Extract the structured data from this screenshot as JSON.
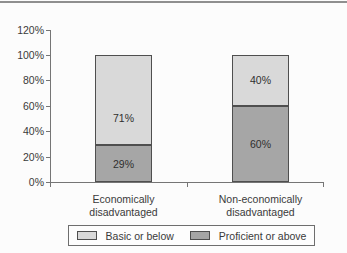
{
  "figure": {
    "background": "#fcfcfc",
    "top_rule_color": "#8f8f8f",
    "axis_color": "#757575",
    "text_color": "#3a3a3a",
    "bar_border_color": "#4f4f4f",
    "legend_border_color": "#6e6e6e"
  },
  "chart_data": {
    "type": "bar",
    "stacked": true,
    "title": "",
    "xlabel": "",
    "ylabel": "",
    "grid": false,
    "categories": [
      "Economically\ndisadvantaged",
      "Non-economically\ndisadvantaged"
    ],
    "series": [
      {
        "name": "Proficient or above",
        "color": "#a6a6a6",
        "values": [
          29,
          60
        ],
        "data_labels": [
          "29%",
          "60%"
        ]
      },
      {
        "name": "Basic or below",
        "color": "#d9d9d9",
        "values": [
          71,
          40
        ],
        "data_labels": [
          "71%",
          "40%"
        ]
      }
    ],
    "y_axis": {
      "min": 0,
      "max": 120,
      "step": 20,
      "tick_labels": [
        "0%",
        "20%",
        "40%",
        "60%",
        "80%",
        "100%",
        "120%"
      ]
    },
    "legend": {
      "position": "bottom",
      "entries": [
        {
          "label": "Basic or below",
          "color": "#d9d9d9"
        },
        {
          "label": "Proficient or above",
          "color": "#a6a6a6"
        }
      ]
    }
  }
}
